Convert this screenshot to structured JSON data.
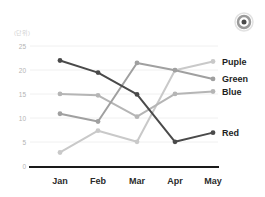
{
  "icon": {
    "name": "record-target-icon"
  },
  "chart_data": {
    "type": "line",
    "title": "",
    "subtitle": "",
    "unit_label": "(단위)",
    "xlabel": "",
    "ylabel": "",
    "categories": [
      "Jan",
      "Feb",
      "Mar",
      "Apr",
      "May"
    ],
    "ylim": [
      0,
      25
    ],
    "yticks": [
      0,
      5,
      10,
      15,
      20,
      25
    ],
    "ytick_labels": [
      "0",
      "5",
      "10",
      "15",
      "20",
      "25"
    ],
    "grid": true,
    "legend_position": "line-end-right",
    "series": [
      {
        "name": "Puple",
        "color": "#c9c9c9",
        "values": [
          3.0,
          7.5,
          5.2,
          20.0,
          21.8
        ]
      },
      {
        "name": "Green",
        "color": "#a0a0a0",
        "values": [
          11.0,
          9.4,
          21.5,
          20.0,
          18.2
        ]
      },
      {
        "name": "Blue",
        "color": "#b5b5b5",
        "values": [
          15.1,
          14.8,
          10.4,
          15.1,
          15.6
        ]
      },
      {
        "name": "Red",
        "color": "#4a4a4a",
        "values": [
          22.0,
          19.5,
          15.0,
          5.2,
          7.1
        ]
      }
    ]
  }
}
